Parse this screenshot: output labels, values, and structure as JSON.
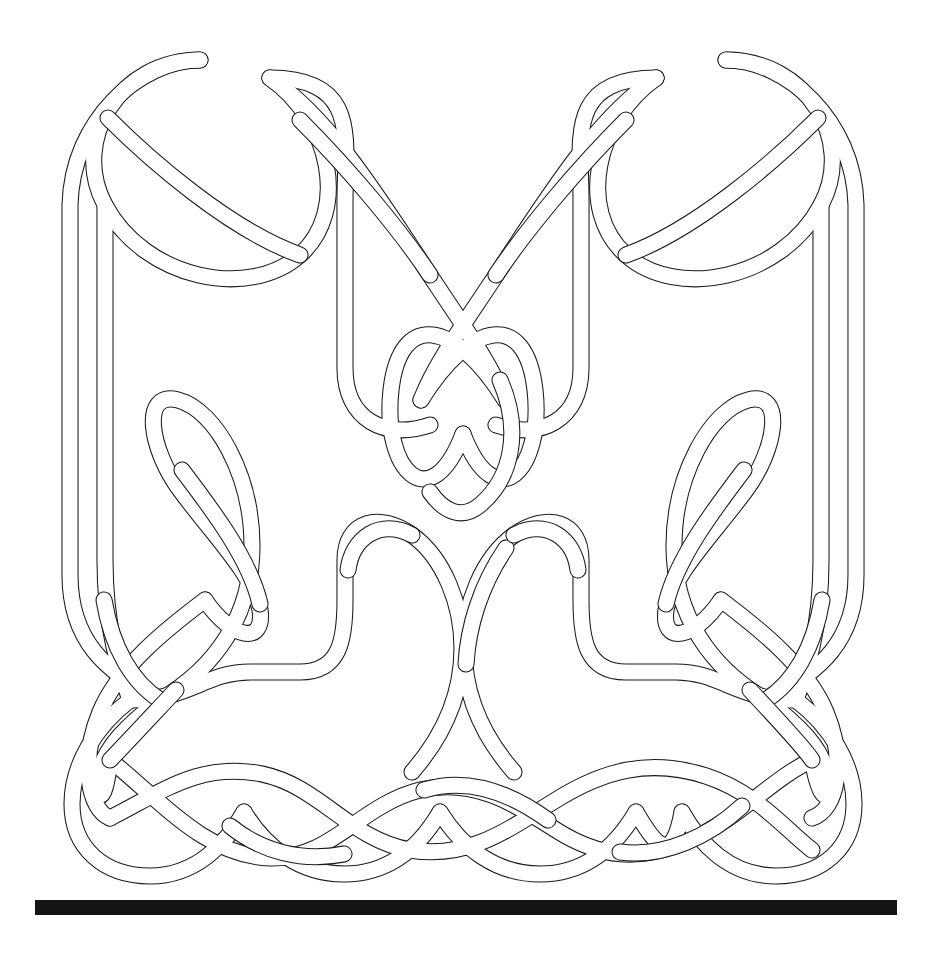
{
  "figure": {
    "kind": "line-drawing",
    "background_color": "#ffffff",
    "ink_color": "#1a1a1a",
    "band_fill_color": "#ffffff",
    "band_outline_width_px": 2,
    "band_total_width_px": 17,
    "canvas": {
      "width": 925,
      "height": 957
    },
    "caption": "",
    "baseline_bar": {
      "name": "baseline-bar",
      "color": "#151515",
      "x": 35,
      "y": 900,
      "width": 862,
      "height": 15
    },
    "knot_bounds": {
      "x": 55,
      "y": 45,
      "width": 815,
      "height": 845
    },
    "elements": [
      {
        "name": "top-left-crossing-cluster",
        "label": ""
      },
      {
        "name": "top-center-crossing-cluster",
        "label": ""
      },
      {
        "name": "top-right-crossing-cluster",
        "label": ""
      },
      {
        "name": "left-figure-eight",
        "label": ""
      },
      {
        "name": "right-figure-eight",
        "label": ""
      },
      {
        "name": "center-oval-weave",
        "label": ""
      },
      {
        "name": "middle-stepped-band-left",
        "label": ""
      },
      {
        "name": "middle-stepped-band-right",
        "label": ""
      },
      {
        "name": "bottom-left-twist",
        "label": ""
      },
      {
        "name": "bottom-center-twist",
        "label": ""
      },
      {
        "name": "bottom-right-twist",
        "label": ""
      },
      {
        "name": "left-border-band",
        "label": ""
      },
      {
        "name": "right-border-band",
        "label": ""
      }
    ]
  }
}
